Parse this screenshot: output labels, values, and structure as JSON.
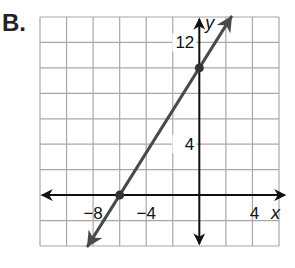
{
  "problem_label": "B.",
  "colors": {
    "grid": "#a8a8a8",
    "axis": "#111111",
    "line": "#4a4a4a",
    "point": "#333333"
  },
  "chart_data": {
    "type": "line",
    "title": "",
    "xlabel": "x",
    "ylabel": "y",
    "xlim": [
      -12,
      6
    ],
    "ylim": [
      -4,
      14
    ],
    "grid": true,
    "grid_step": 2,
    "x_tick_labels": [
      {
        "value": -8,
        "text": "−8"
      },
      {
        "value": -4,
        "text": "−4"
      },
      {
        "value": 4,
        "text": "4"
      }
    ],
    "y_tick_labels": [
      {
        "value": 12,
        "text": "12"
      },
      {
        "value": 4,
        "text": "4"
      }
    ],
    "series": [
      {
        "name": "line",
        "slope": 1.6667,
        "y_intercept": 10,
        "x_intercept": -6,
        "arrows": "both",
        "points": [
          {
            "x": -6,
            "y": 0
          },
          {
            "x": 0,
            "y": 10
          }
        ]
      }
    ]
  },
  "axis_labels": {
    "x": "x",
    "y": "y"
  }
}
